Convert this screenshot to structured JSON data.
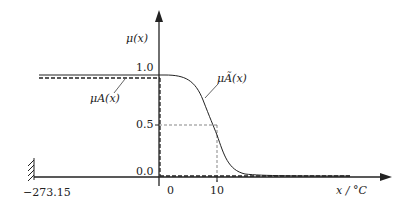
{
  "diagram": {
    "y_axis_label": "μ(x)",
    "x_axis_label": "x / °C",
    "y_ticks": [
      "1.0",
      "0.5",
      "0.0"
    ],
    "x_ticks": [
      "0",
      "10"
    ],
    "absolute_zero_label": "−273.15",
    "curves": [
      {
        "name": "μA(x)",
        "label": "μ_A(x)",
        "style": "dashed",
        "description": "crisp set: 1 for x<0, 0 for x≥0"
      },
      {
        "name": "μÃ(x)",
        "label": "μ_Ã(x)",
        "style": "solid",
        "description": "fuzzy set: smooth sigmoid decreasing, 0.5 at x=10"
      }
    ],
    "colors": {
      "line": "#222222",
      "guide": "#555555"
    }
  },
  "labels": {
    "mu": "μ(x)",
    "one": "1.0",
    "half": "0.5",
    "zero_y": "0.0",
    "zero_x": "0",
    "ten": "10",
    "abs_zero": "−273.15",
    "xunit": "x / °C",
    "muA": "μA(x)",
    "muAt": "μÃ(x)"
  }
}
